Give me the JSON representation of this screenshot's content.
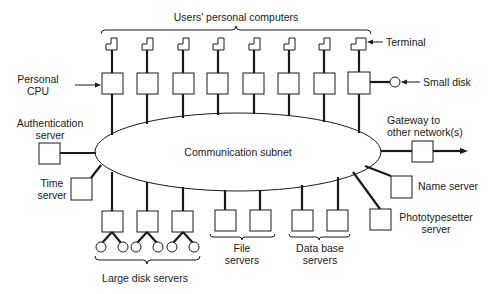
{
  "diagram": {
    "top_bracket_label": "Users' personal computers",
    "terminal_label": "Terminal",
    "personal_cpu_label": [
      "Personal",
      "CPU"
    ],
    "small_disk_label": "Small disk",
    "auth_server_label": [
      "Authentication",
      "server"
    ],
    "time_server_label": [
      "Time",
      "server"
    ],
    "subnet_label": "Communication subnet",
    "gateway_label": [
      "Gateway to",
      "other network(s)"
    ],
    "name_server_label": "Name server",
    "phototypesetter_label": [
      "Phototypesetter",
      "server"
    ],
    "large_disk_label": "Large disk servers",
    "file_servers_label": [
      "File",
      "servers"
    ],
    "database_servers_label": [
      "Data base",
      "servers"
    ],
    "user_computer_count": 8,
    "large_disk_server_count": 3,
    "file_server_count": 2,
    "database_server_count": 2
  }
}
